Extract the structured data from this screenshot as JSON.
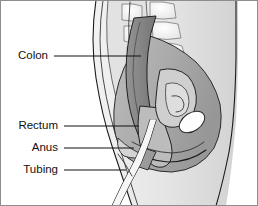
{
  "figure": {
    "background_color": "#ffffff",
    "frame_color": "#8d8d8d",
    "line_color": "#111111",
    "width": 258,
    "height": 206
  },
  "labels": [
    {
      "id": "colon",
      "text": "Colon",
      "text_x": 48,
      "text_y": 56,
      "leader_x1": 54,
      "leader_x2": 141,
      "leader_y": 56
    },
    {
      "id": "rectum",
      "text": "Rectum",
      "text_x": 58,
      "text_y": 126,
      "leader_x1": 64,
      "leader_x2": 139,
      "leader_y": 126
    },
    {
      "id": "anus",
      "text": "Anus",
      "text_x": 58,
      "text_y": 148,
      "leader_x1": 64,
      "leader_x2": 134,
      "leader_y": 148
    },
    {
      "id": "tubing",
      "text": "Tubing",
      "text_x": 58,
      "text_y": 170,
      "leader_x1": 64,
      "leader_x2": 126,
      "leader_y": 170
    }
  ],
  "palette": {
    "body_light": "#e9e9e9",
    "tissue_light": "#dcdcdc",
    "tissue_mid": "#c4c4c4",
    "tissue_gray": "#a9a9a9",
    "organ_dark": "#8a8a8a",
    "colon_dark": "#707070",
    "bone_white": "#fbfbfb",
    "vertebra_fill": "#ededed",
    "highlight": "#ffffff"
  },
  "structures": [
    {
      "id": "body-outline",
      "name": "body outline"
    },
    {
      "id": "sacrum-vertebrae",
      "name": "sacrum and vertebrae"
    },
    {
      "id": "colon-descending",
      "name": "descending colon"
    },
    {
      "id": "rectum-body",
      "name": "rectum"
    },
    {
      "id": "bladder",
      "name": "bladder"
    },
    {
      "id": "pubic-bone",
      "name": "pubic bone"
    },
    {
      "id": "anal-canal",
      "name": "anal canal"
    },
    {
      "id": "rectal-tube",
      "name": "rectal tubing"
    }
  ]
}
